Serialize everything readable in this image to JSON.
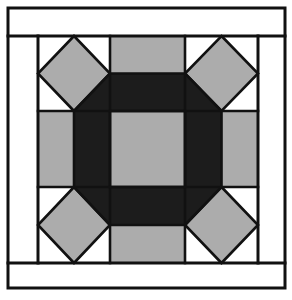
{
  "figure": {
    "title": "Quilt Block Diagram",
    "type": "pieced-quilt-block",
    "block_name": "Octagon Snowball Block",
    "canvas": {
      "width": 292,
      "height": 300,
      "background": "#ffffff"
    }
  },
  "palette": {
    "background": "#ffffff",
    "light": "#ffffff",
    "medium_gray": "#acacac",
    "dark": "#1c1c1c",
    "line": "#111111"
  },
  "geometry": {
    "outer_frame": {
      "x": 8,
      "y": 8,
      "width": 277,
      "height": 280
    },
    "inner_frame": {
      "x": 8,
      "y": 36,
      "width": 277,
      "height": 227
    },
    "block_area": {
      "x": 38,
      "y": 36,
      "width": 220,
      "height": 227
    },
    "grid": {
      "columns": [
        38,
        110,
        185,
        258
      ],
      "rows": [
        36,
        111,
        187,
        263
      ]
    },
    "center_square": {
      "x": 110,
      "y": 111,
      "width": 75,
      "height": 76
    },
    "corner_diamond_inset": 0
  },
  "parts": {
    "outer_border_label": "outer border",
    "side_border_label": "side border",
    "corner_diamond_label": "corner square-on-point",
    "edge_rectangle_label": "edge rectangle",
    "octagon_ring_label": "dark octagon ring",
    "center_label": "center square"
  },
  "chart_data": {
    "type": "table",
    "title": "Quilt Block Diagram",
    "categories": [
      "outer-border",
      "top-border-strip",
      "bottom-border-strip",
      "left-border-strip",
      "right-border-strip",
      "corner-diamond-top-left",
      "corner-diamond-top-right",
      "corner-diamond-bottom-left",
      "corner-diamond-bottom-right",
      "edge-rect-top",
      "edge-rect-bottom",
      "edge-rect-left",
      "edge-rect-right",
      "octagon-ring",
      "center-square"
    ],
    "values": [
      {
        "shape": "rectangle-outline",
        "fill": "#ffffff"
      },
      {
        "shape": "rectangle",
        "fill": "#ffffff"
      },
      {
        "shape": "rectangle",
        "fill": "#ffffff"
      },
      {
        "shape": "rectangle",
        "fill": "#ffffff"
      },
      {
        "shape": "rectangle",
        "fill": "#ffffff"
      },
      {
        "shape": "diamond",
        "fill": "#acacac"
      },
      {
        "shape": "diamond",
        "fill": "#acacac"
      },
      {
        "shape": "diamond",
        "fill": "#acacac"
      },
      {
        "shape": "diamond",
        "fill": "#acacac"
      },
      {
        "shape": "rectangle",
        "fill": "#acacac"
      },
      {
        "shape": "rectangle",
        "fill": "#acacac"
      },
      {
        "shape": "rectangle",
        "fill": "#acacac"
      },
      {
        "shape": "rectangle",
        "fill": "#acacac"
      },
      {
        "shape": "octagon-ring",
        "fill": "#1c1c1c"
      },
      {
        "shape": "square",
        "fill": "#acacac"
      }
    ],
    "xlabel": "",
    "ylabel": "",
    "legend": [
      "light / background",
      "medium gray",
      "dark"
    ],
    "grid": false
  }
}
